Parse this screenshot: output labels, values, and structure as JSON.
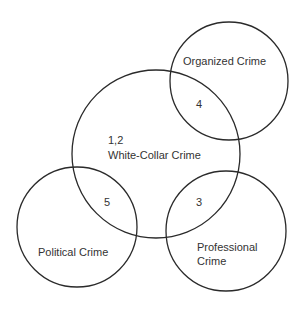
{
  "diagram": {
    "type": "venn",
    "circles": [
      {
        "id": "white-collar",
        "label": "White-Collar Crime",
        "number": "1,2"
      },
      {
        "id": "organized",
        "label": "Organized Crime"
      },
      {
        "id": "political",
        "label": "Political Crime"
      },
      {
        "id": "professional",
        "label_line1": "Professional",
        "label_line2": "Crime"
      }
    ],
    "overlaps": [
      {
        "between": [
          "white-collar",
          "organized"
        ],
        "number": "4"
      },
      {
        "between": [
          "white-collar",
          "political"
        ],
        "number": "5"
      },
      {
        "between": [
          "white-collar",
          "professional"
        ],
        "number": "3"
      }
    ],
    "stroke_color": "#2a2a2a"
  }
}
